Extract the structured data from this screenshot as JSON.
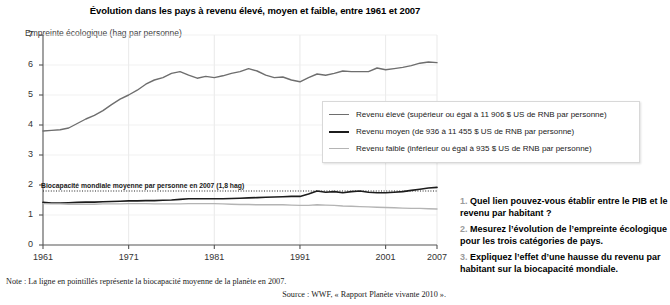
{
  "chart_data": {
    "type": "line",
    "title": "Évolution dans les pays à revenu élevé, moyen et faible, entre 1961 et 2007",
    "ylabel": "Empreinte écologique (hag par personne)",
    "xlabel": "",
    "xlim": [
      1961,
      2007
    ],
    "ylim": [
      0,
      7
    ],
    "yticks": [
      0,
      1,
      2,
      3,
      4,
      5,
      6,
      7
    ],
    "xticks": [
      1961,
      1971,
      1981,
      1991,
      2001,
      2007
    ],
    "grid": true,
    "legend_position": "center-right",
    "annotation": "Biocapacité mondiale moyenne par personne en 2007 (1,8 hag)",
    "reference_line": {
      "label": "Biocapacité mondiale moyenne par personne en 2007 (1,8 hag)",
      "value": 1.8,
      "style": "dotted"
    },
    "x": [
      1961,
      1962,
      1963,
      1964,
      1965,
      1966,
      1967,
      1968,
      1969,
      1970,
      1971,
      1972,
      1973,
      1974,
      1975,
      1976,
      1977,
      1978,
      1979,
      1980,
      1981,
      1982,
      1983,
      1984,
      1985,
      1986,
      1987,
      1988,
      1989,
      1990,
      1991,
      1992,
      1993,
      1994,
      1995,
      1996,
      1997,
      1998,
      1999,
      2000,
      2001,
      2002,
      2003,
      2004,
      2005,
      2006,
      2007
    ],
    "series": [
      {
        "name": "Revenu élevé (supérieur ou égal à 11 906 $ US de RNB par personne)",
        "color": "#6e6e6e",
        "values": [
          3.8,
          3.82,
          3.84,
          3.9,
          4.05,
          4.2,
          4.32,
          4.48,
          4.68,
          4.86,
          5.0,
          5.16,
          5.36,
          5.5,
          5.58,
          5.72,
          5.78,
          5.66,
          5.56,
          5.62,
          5.58,
          5.64,
          5.72,
          5.78,
          5.88,
          5.8,
          5.66,
          5.58,
          5.6,
          5.5,
          5.44,
          5.58,
          5.7,
          5.66,
          5.72,
          5.8,
          5.78,
          5.78,
          5.78,
          5.9,
          5.84,
          5.88,
          5.92,
          5.98,
          6.06,
          6.1,
          6.08
        ]
      },
      {
        "name": "Revenu moyen (de 936 à 11 455 $ US de RNB par personne)",
        "color": "#1c1c1c",
        "values": [
          1.42,
          1.4,
          1.4,
          1.41,
          1.42,
          1.43,
          1.43,
          1.44,
          1.45,
          1.46,
          1.47,
          1.47,
          1.48,
          1.48,
          1.49,
          1.5,
          1.52,
          1.54,
          1.54,
          1.54,
          1.54,
          1.54,
          1.55,
          1.56,
          1.57,
          1.58,
          1.59,
          1.6,
          1.61,
          1.62,
          1.62,
          1.7,
          1.8,
          1.76,
          1.78,
          1.74,
          1.78,
          1.8,
          1.76,
          1.74,
          1.74,
          1.76,
          1.78,
          1.82,
          1.86,
          1.9,
          1.92
        ]
      },
      {
        "name": "Revenu faible (inférieur ou égal à 935 $ US de RNB par personne)",
        "color": "#b4b4b4",
        "values": [
          1.38,
          1.37,
          1.37,
          1.36,
          1.36,
          1.36,
          1.36,
          1.37,
          1.37,
          1.37,
          1.38,
          1.38,
          1.38,
          1.37,
          1.37,
          1.37,
          1.37,
          1.38,
          1.38,
          1.38,
          1.38,
          1.37,
          1.36,
          1.35,
          1.35,
          1.34,
          1.34,
          1.34,
          1.34,
          1.33,
          1.32,
          1.32,
          1.34,
          1.33,
          1.32,
          1.3,
          1.29,
          1.28,
          1.27,
          1.26,
          1.25,
          1.24,
          1.23,
          1.22,
          1.22,
          1.21,
          1.2
        ]
      }
    ]
  },
  "note": "Note : La ligne en pointillés représente la biocapacité moyenne de la planète en 2007.",
  "source": "Source : WWF, « Rapport Planète vivante 2010 ».",
  "questions": [
    {
      "num": "1.",
      "text": "Quel lien pouvez-vous établir entre le PIB et le revenu par habitant ?"
    },
    {
      "num": "2.",
      "text": "Mesurez l’évolution de l’empreinte écologique pour les trois catégories de pays."
    },
    {
      "num": "3.",
      "text": "Expliquez l’effet d’une hausse du revenu par habitant sur la biocapacité mondiale."
    }
  ]
}
